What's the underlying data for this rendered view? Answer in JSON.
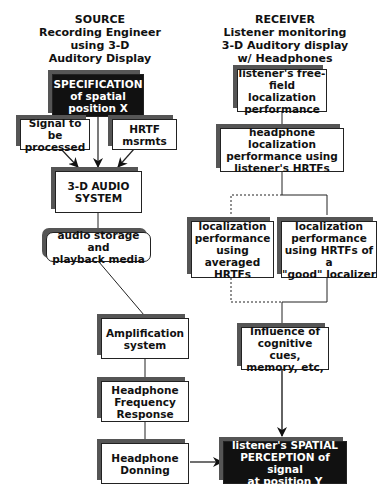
{
  "source_header": "SOURCE\nRecording Engineer\nusing 3-D\nAuditory Display",
  "receiver_header": "RECEIVER\nListener monitoring\n3-D Auditory display\nw/ Headphones",
  "source_boxes": {
    "specification": "SPECIFICATION\nof spatial\nposition X",
    "signal": "Signal to be\nprocessed",
    "hrtf": "HRTF\nmsrmts",
    "audio_system": "3-D AUDIO\nSYSTEM",
    "storage": "audio storage and\nplayback media",
    "amplification": "Amplification\nsystem",
    "frequency": "Headphone\nFrequency\nResponse",
    "donning": "Headphone\nDonning"
  },
  "receiver_boxes": {
    "free_field": "listener's free-\nfield localization\nperformance",
    "headphone_loc": "headphone localization\nperformance using\nlistener's HRTFs",
    "averaged": "localization\nperformance\nusing averaged\nHRTFs",
    "good": "localization\nperformance\nusing HRTFs of a\n\"good\" localizer",
    "cognitive": "Influence of\ncognitive cues,\nmemory, etc,",
    "perception": "listener's SPATIAL\nPERCEPTION of signal\nat position Y"
  }
}
